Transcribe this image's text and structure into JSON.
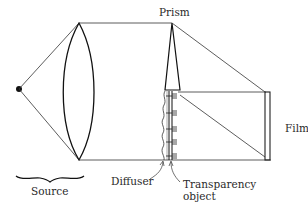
{
  "labels": {
    "prism": "Prism",
    "film": "Film",
    "source": "Source",
    "diffuser": "Diffuser",
    "transparency_line1": "Transparency",
    "transparency_line2": "object"
  },
  "components": [
    {
      "name": "source",
      "type": "point light source"
    },
    {
      "name": "lens",
      "type": "biconvex lens"
    },
    {
      "name": "prism",
      "type": "thin wedge prism"
    },
    {
      "name": "diffuser",
      "type": "wavy diffuser plate"
    },
    {
      "name": "transparency-object",
      "type": "transparency with marks"
    },
    {
      "name": "film",
      "type": "film plate"
    }
  ],
  "colors": {
    "line": "#222222",
    "text": "#2a2a2a",
    "background": "#ffffff"
  }
}
